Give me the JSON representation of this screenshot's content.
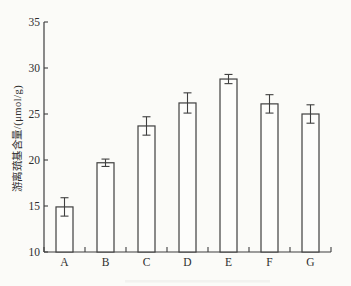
{
  "chart_data": {
    "type": "bar",
    "title": "",
    "xlabel": "",
    "ylabel": "游离巯基含量/(μmol/g)",
    "categories": [
      "A",
      "B",
      "C",
      "D",
      "E",
      "F",
      "G"
    ],
    "values": [
      14.9,
      19.7,
      23.7,
      26.2,
      28.8,
      26.1,
      25.0
    ],
    "errors": [
      1.0,
      0.4,
      1.0,
      1.1,
      0.5,
      1.0,
      1.0
    ],
    "ylim": [
      10,
      35
    ],
    "yticks": [
      10,
      15,
      20,
      25,
      30,
      35
    ],
    "grid": false,
    "bar_fill": "#fdfdfb",
    "bar_stroke": "#3f3f3f",
    "axis_color": "#3f3f3f",
    "text_color": "#2e2e2e",
    "background": "#fbfbf8"
  }
}
